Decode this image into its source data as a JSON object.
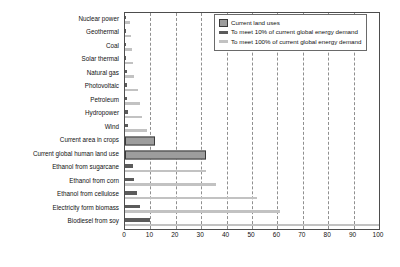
{
  "chart_data": {
    "type": "bar",
    "orientation": "horizontal",
    "title": "",
    "xlabel": "",
    "ylabel": "",
    "xlim": [
      0,
      100
    ],
    "xticks": [
      0,
      10,
      20,
      30,
      40,
      50,
      60,
      70,
      80,
      90,
      100
    ],
    "grid": true,
    "grid_axis": "x",
    "grid_style": "dashed",
    "legend_position": "top-right",
    "categories": [
      "Nuclear power",
      "Geothermal",
      "Coal",
      "Solar thermal",
      "Natural gas",
      "Photovoltaic",
      "Petroleum",
      "Hydropower",
      "Wind",
      "Current area in crops",
      "Current global human land use",
      "Ethanol from sugarcane",
      "Ethanol from corn",
      "Ethanol from cellulose",
      "Electricity form biomass",
      "Biodiesel from soy"
    ],
    "series": [
      {
        "name": "Current land uses",
        "color": "#9d9d9d",
        "edge_color": "#3a3a3a",
        "values": [
          0,
          0,
          0,
          0,
          0,
          0,
          0,
          0,
          0,
          12,
          32,
          0,
          0,
          0,
          0,
          0
        ]
      },
      {
        "name": "To meet 10% of current global energy demand",
        "color": "#5b5b5b",
        "values": [
          0.3,
          0.4,
          0.4,
          0.5,
          0.6,
          0.8,
          0.9,
          1.0,
          1.3,
          0,
          0,
          3.2,
          3.6,
          4.8,
          6.0,
          10.0
        ]
      },
      {
        "name": "To meet 100% of current global energy demand",
        "color": "#c2c2c2",
        "values": [
          2.0,
          2.4,
          2.6,
          3.0,
          3.6,
          5.0,
          6.0,
          6.6,
          8.6,
          0,
          0,
          32.0,
          36.0,
          52.0,
          61.0,
          100.0
        ]
      }
    ]
  },
  "legend": {
    "items": [
      {
        "label": "Current land uses"
      },
      {
        "label": "To meet 10% of current global energy demand"
      },
      {
        "label": "To meet 100% of current global energy demand"
      }
    ]
  }
}
